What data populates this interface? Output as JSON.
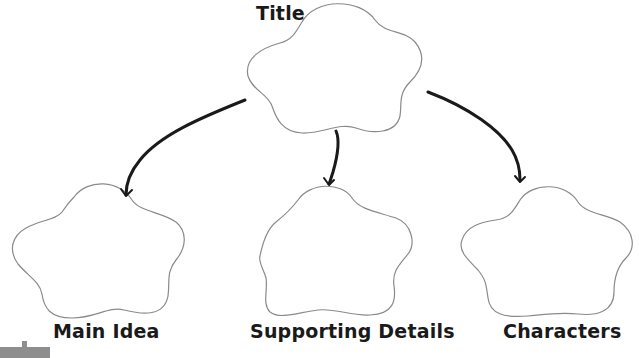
{
  "diagram": {
    "type": "graphic-organizer",
    "root": {
      "label": "Title",
      "shape": "cloud"
    },
    "children": [
      {
        "label": "Main Idea",
        "shape": "cloud"
      },
      {
        "label": "Supporting Details",
        "shape": "cloud"
      },
      {
        "label": "Characters",
        "shape": "cloud"
      }
    ],
    "edges": [
      {
        "from": "Title",
        "to": "Main Idea"
      },
      {
        "from": "Title",
        "to": "Supporting Details"
      },
      {
        "from": "Title",
        "to": "Characters"
      }
    ],
    "colors": {
      "outline": "#8a8a8a",
      "arrow": "#1a1a1a",
      "text": "#1a1a1a",
      "corner_tab": "#8e8e8e"
    }
  }
}
